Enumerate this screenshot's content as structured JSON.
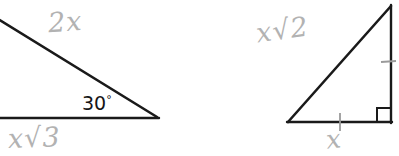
{
  "figure": {
    "background_color": "#ffffff",
    "ink_color": "#1a1a1a",
    "pencil_color": "#b2b2b2",
    "left_triangle": {
      "name": "30-60-90 triangle",
      "hypotenuse_label": "2x",
      "base_label": "x√3",
      "angle_label": "30",
      "degree_symbol": "°"
    },
    "right_triangle": {
      "name": "45-45-90 right triangle",
      "hypotenuse_label": "x√2",
      "base_label": "x",
      "vertical_label": "",
      "right_angle_marker": "square"
    }
  }
}
